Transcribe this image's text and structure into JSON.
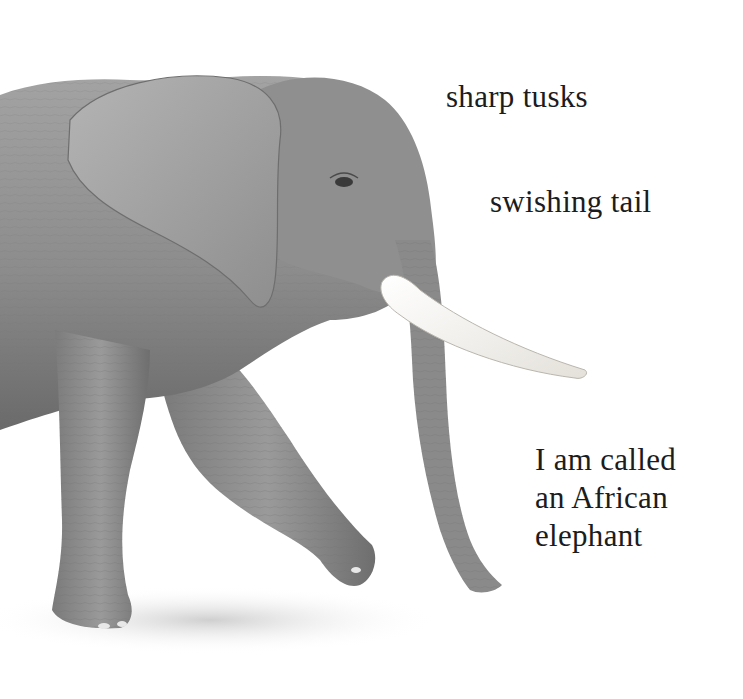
{
  "page": {
    "background": "#ffffff",
    "text_color": "#1c1c1c"
  },
  "illustration": {
    "subject": "african-elephant",
    "style": "graphite-pencil-drawing",
    "colors": {
      "body_light": "#a9a9a9",
      "body_mid": "#8a8a8a",
      "body_dark": "#5e5e5e",
      "shadow": "#d6d6d6",
      "tusk": "#f3f1ec"
    }
  },
  "captions": {
    "tusks": "sharp tusks",
    "tail": "swishing tail",
    "name_lines": [
      "I am called",
      "an African",
      "elephant"
    ]
  }
}
